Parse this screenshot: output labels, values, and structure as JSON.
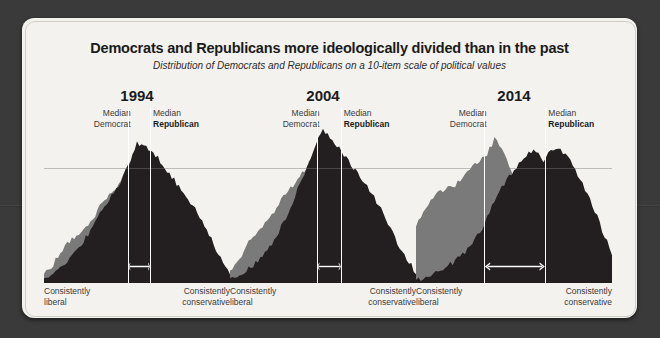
{
  "figure": {
    "title": "Democrats and Republicans more ideologically divided than in the past",
    "subtitle": "Distribution of Democrats and Republicans on a 10-item scale of political values",
    "axis_left_line1": "Consistently",
    "axis_left_line2": "liberal",
    "axis_right_line1": "Consistently",
    "axis_right_line2": "conservative",
    "median_dem_line1": "Median",
    "median_dem_line2": "Democrat",
    "median_rep_line1": "Median",
    "median_rep_line2": "Republican",
    "colors": {
      "backdrop": "#3a3a3a",
      "card": "#f3f2ef",
      "democrat": "#7a7a7a",
      "republican": "#231f20",
      "median_line": "#ffffff",
      "gridline": "#787878",
      "text": "#1b1b1b"
    }
  },
  "chart_data": {
    "type": "area",
    "title": "Democrats and Republicans more ideologically divided than in the past",
    "subtitle": "Distribution of Democrats and Republicans on a 10-item scale of political values",
    "xlabel": "10-item scale of political values (consistently liberal → consistently conservative)",
    "ylabel": "Share of party (distribution density)",
    "x": [
      0,
      1,
      2,
      3,
      4,
      5,
      6,
      7,
      8,
      9,
      10,
      11,
      12,
      13,
      14,
      15,
      16,
      17,
      18,
      19,
      20
    ],
    "xlim": [
      0,
      20
    ],
    "ylim": [
      0,
      100
    ],
    "grid": true,
    "legend": [
      "Democrat",
      "Republican"
    ],
    "legend_position": "none",
    "panels": [
      {
        "year": "1994",
        "median_democrat_x": 9.0,
        "median_republican_x": 11.4,
        "annotation": "median gap arrow",
        "series": [
          {
            "name": "Democrat",
            "color": "#7a7a7a",
            "values": [
              6,
              12,
              22,
              28,
              33,
              38,
              49,
              56,
              62,
              74,
              84,
              86,
              72,
              58,
              46,
              34,
              26,
              18,
              12,
              7,
              4
            ]
          },
          {
            "name": "Republican",
            "color": "#231f20",
            "values": [
              3,
              6,
              10,
              17,
              24,
              34,
              44,
              54,
              63,
              74,
              90,
              88,
              82,
              74,
              66,
              58,
              50,
              40,
              28,
              16,
              7
            ]
          }
        ]
      },
      {
        "year": "2004",
        "median_democrat_x": 9.3,
        "median_republican_x": 11.9,
        "annotation": "median gap arrow",
        "series": [
          {
            "name": "Democrat",
            "color": "#7a7a7a",
            "values": [
              8,
              15,
              26,
              34,
              40,
              48,
              58,
              64,
              72,
              82,
              88,
              80,
              70,
              60,
              50,
              40,
              30,
              22,
              14,
              8,
              4
            ]
          },
          {
            "name": "Republican",
            "color": "#231f20",
            "values": [
              3,
              5,
              9,
              14,
              20,
              30,
              42,
              56,
              70,
              86,
              98,
              92,
              84,
              76,
              68,
              60,
              50,
              38,
              26,
              15,
              7
            ]
          }
        ]
      },
      {
        "year": "2014",
        "median_democrat_x": 6.9,
        "median_republican_x": 13.2,
        "annotation": "median gap arrow",
        "series": [
          {
            "name": "Democrat",
            "color": "#7a7a7a",
            "values": [
              36,
              48,
              58,
              60,
              62,
              70,
              76,
              80,
              92,
              84,
              66,
              50,
              40,
              34,
              28,
              22,
              16,
              11,
              7,
              4,
              2
            ]
          },
          {
            "name": "Republican",
            "color": "#231f20",
            "values": [
              2,
              4,
              7,
              10,
              14,
              20,
              28,
              38,
              52,
              64,
              72,
              80,
              86,
              78,
              86,
              84,
              76,
              64,
              50,
              34,
              18
            ]
          }
        ]
      }
    ]
  }
}
